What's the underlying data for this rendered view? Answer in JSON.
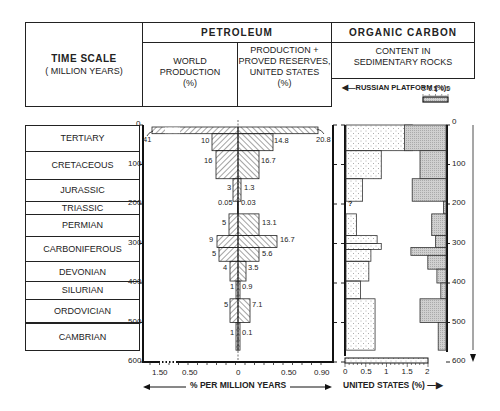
{
  "header": {
    "time_scale_title": "TIME SCALE",
    "time_scale_sub": "( MILLION YEARS)",
    "petroleum_title": "PETROLEUM",
    "world_production_l1": "WORLD",
    "world_production_l2": "PRODUCTION",
    "world_production_l3": "(%)",
    "us_reserves_l1": "PRODUCTION +",
    "us_reserves_l2": "PROVED RESERVES,",
    "us_reserves_l3": "UNITED STATES",
    "us_reserves_l4": "(%)",
    "organic_carbon_title": "ORGANIC CARBON",
    "content_l1": "CONTENT IN",
    "content_l2": "SEDIMENTARY ROCKS",
    "russian_platform_label": "RUSSIAN  PLATFORM (%)",
    "russian_scale_ticks": [
      "2",
      "1.5",
      "1",
      "0.5",
      "0"
    ]
  },
  "eras": [
    {
      "name": "TERTIARY",
      "start": 0,
      "end": 65
    },
    {
      "name": "CRETACEOUS",
      "start": 65,
      "end": 136
    },
    {
      "name": "JURASSIC",
      "start": 136,
      "end": 193
    },
    {
      "name": "TRIASSIC",
      "start": 193,
      "end": 225
    },
    {
      "name": "PERMIAN",
      "start": 225,
      "end": 280
    },
    {
      "name": "CARBONIFEROUS",
      "start": 280,
      "end": 345
    },
    {
      "name": "DEVONIAN",
      "start": 345,
      "end": 395
    },
    {
      "name": "SILURIAN",
      "start": 395,
      "end": 440
    },
    {
      "name": "ORDOVICIAN",
      "start": 440,
      "end": 500
    },
    {
      "name": "CAMBRIAN",
      "start": 500,
      "end": 570
    }
  ],
  "y_axis_ticks": [
    "0",
    "100",
    "200",
    "300",
    "400",
    "500",
    "600"
  ],
  "petroleum_axis": {
    "left_ticks": [
      "1.50",
      "0.50"
    ],
    "center_tick": "0",
    "right_ticks": [
      "0.50",
      "0.90"
    ],
    "label": "% PER MILLION YEARS"
  },
  "carbon_axis": {
    "us_ticks": [
      "0",
      "0.5",
      "1",
      "1.5",
      "2"
    ],
    "us_label": "UNITED STATES (%)"
  },
  "chart_data": [
    {
      "type": "bar",
      "title": "PETROLEUM — World Production (%) vs Production + Proved Reserves, United States (%)",
      "xlabel": "% PER MILLION YEARS",
      "ylabel": "TIME SCALE (MILLION YEARS)",
      "ylim": [
        0,
        600
      ],
      "orientation": "horizontal-butterfly",
      "categories": [
        "Tertiary",
        "Cretaceous",
        "Jurassic",
        "Triassic",
        "Permian",
        "Carboniferous (upper)",
        "Carboniferous (lower)",
        "Devonian",
        "Silurian",
        "Ordovician",
        "Cambrian"
      ],
      "series": [
        {
          "name": "World Production (%)",
          "side": "left",
          "labels": [
            "41",
            "10",
            "16",
            "3",
            "0.05",
            "5",
            "9",
            "5",
            "4",
            "1",
            "5",
            "1"
          ]
        },
        {
          "name": "Production + Proved Reserves, United States (%)",
          "side": "right",
          "labels": [
            "20.8",
            "14.8",
            "16.7",
            "1.3",
            "0.03",
            "13.1",
            "16.7",
            "5.6",
            "3.5",
            "0.9",
            "7.1",
            "0.1"
          ]
        }
      ],
      "bars": [
        {
          "period": "Tertiary (upper)",
          "top": 0,
          "bottom": 25,
          "world": 41,
          "us": 20.8,
          "world_rate": 1.6,
          "us_rate": 0.83
        },
        {
          "period": "Tertiary (lower)",
          "top": 25,
          "bottom": 65,
          "world": 10,
          "us": 14.8,
          "world_rate": 0.25,
          "us_rate": 0.37
        },
        {
          "period": "Cretaceous",
          "top": 65,
          "bottom": 136,
          "world": 16,
          "us": 16.7,
          "world_rate": 0.23,
          "us_rate": 0.24
        },
        {
          "period": "Jurassic",
          "top": 136,
          "bottom": 193,
          "world": 3,
          "us": 1.3,
          "world_rate": 0.05,
          "us_rate": 0.02
        },
        {
          "period": "Triassic",
          "top": 193,
          "bottom": 225,
          "world": 0.05,
          "us": 0.03,
          "world_rate": 0.001,
          "us_rate": 0.001
        },
        {
          "period": "Permian",
          "top": 225,
          "bottom": 280,
          "world": 5,
          "us": 13.1,
          "world_rate": 0.09,
          "us_rate": 0.24
        },
        {
          "period": "Carboniferous (upper)",
          "top": 280,
          "bottom": 310,
          "world": 9,
          "us": 16.7,
          "world_rate": 0.3,
          "us_rate": 0.56
        },
        {
          "period": "Carboniferous (lower)",
          "top": 310,
          "bottom": 345,
          "world": 5,
          "us": 5.6,
          "world_rate": 0.14,
          "us_rate": 0.16
        },
        {
          "period": "Devonian",
          "top": 345,
          "bottom": 395,
          "world": 4,
          "us": 3.5,
          "world_rate": 0.08,
          "us_rate": 0.07
        },
        {
          "period": "Silurian",
          "top": 395,
          "bottom": 440,
          "world": 1,
          "us": 0.9,
          "world_rate": 0.02,
          "us_rate": 0.02
        },
        {
          "period": "Ordovician",
          "top": 440,
          "bottom": 500,
          "world": 5,
          "us": 7.1,
          "world_rate": 0.08,
          "us_rate": 0.12
        },
        {
          "period": "Cambrian",
          "top": 500,
          "bottom": 570,
          "world": 1,
          "us": 0.1,
          "world_rate": 0.01,
          "us_rate": 0.01
        }
      ],
      "x_ticks_left": [
        "1.50",
        "0.50",
        "0"
      ],
      "x_ticks_right": [
        "0",
        "0.50",
        "0.90"
      ]
    },
    {
      "type": "bar",
      "title": "ORGANIC CARBON — Content in Sedimentary Rocks",
      "ylabel": "TIME SCALE (MILLION YEARS)",
      "ylim": [
        0,
        600
      ],
      "series": [
        {
          "name": "United States (%)",
          "xlim": [
            0,
            2
          ],
          "bars": [
            {
              "top": 0,
              "bottom": 65,
              "value": 1.6
            },
            {
              "top": 65,
              "bottom": 136,
              "value": 0.85
            },
            {
              "top": 136,
              "bottom": 193,
              "value": 0.4
            },
            {
              "top": 193,
              "bottom": 225,
              "value": null,
              "note": "?"
            },
            {
              "top": 225,
              "bottom": 280,
              "value": 0.25
            },
            {
              "top": 280,
              "bottom": 300,
              "value": 0.75
            },
            {
              "top": 300,
              "bottom": 315,
              "value": 0.85
            },
            {
              "top": 315,
              "bottom": 345,
              "value": 0.6
            },
            {
              "top": 345,
              "bottom": 395,
              "value": 0.55
            },
            {
              "top": 395,
              "bottom": 440,
              "value": 0.35
            },
            {
              "top": 440,
              "bottom": 570,
              "value": 0.7
            }
          ]
        },
        {
          "name": "Russian Platform (%)",
          "xlim": [
            2,
            0
          ],
          "bars": [
            {
              "top": 0,
              "bottom": 65,
              "value": 1.6
            },
            {
              "top": 65,
              "bottom": 136,
              "value": 1.0
            },
            {
              "top": 136,
              "bottom": 193,
              "value": 1.3
            },
            {
              "top": 193,
              "bottom": 225,
              "value": 0.1
            },
            {
              "top": 225,
              "bottom": 280,
              "value": 0.55
            },
            {
              "top": 280,
              "bottom": 310,
              "value": 0.4
            },
            {
              "top": 310,
              "bottom": 330,
              "value": 1.35
            },
            {
              "top": 330,
              "bottom": 365,
              "value": 0.7
            },
            {
              "top": 365,
              "bottom": 400,
              "value": 0.35
            },
            {
              "top": 400,
              "bottom": 440,
              "value": 0.2
            },
            {
              "top": 440,
              "bottom": 500,
              "value": 1.0
            },
            {
              "top": 500,
              "bottom": 570,
              "value": 0.3
            }
          ]
        }
      ],
      "x_ticks_us": [
        "0",
        "0.5",
        "1",
        "1.5",
        "2"
      ],
      "x_ticks_russian": [
        "2",
        "1.5",
        "1",
        "0.5",
        "0"
      ]
    }
  ]
}
